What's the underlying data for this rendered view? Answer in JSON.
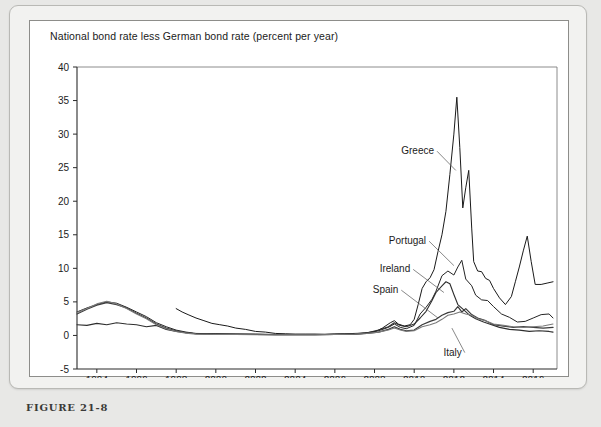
{
  "figure": {
    "caption": "FIGURE 21-8"
  },
  "chart_data": {
    "type": "line",
    "title": "National bond rate less German bond rate (percent per year)",
    "xlabel": "",
    "ylabel": "",
    "xlim": [
      1993.0,
      2017.2
    ],
    "ylim": [
      -5,
      40
    ],
    "ytick_values": [
      -5,
      0,
      5,
      10,
      15,
      20,
      25,
      30,
      35,
      40
    ],
    "ytick_labels": [
      "-5",
      "0",
      "5",
      "10",
      "15",
      "20",
      "25",
      "30",
      "35",
      "40"
    ],
    "xtick_values": [
      1994,
      1996,
      1998,
      2000,
      2002,
      2004,
      2006,
      2008,
      2010,
      2012,
      2014,
      2016
    ],
    "xtick_labels": [
      "1994",
      "1996",
      "1998",
      "2000",
      "2002",
      "2004",
      "2006",
      "2008",
      "2010",
      "2012",
      "2014",
      "2016"
    ],
    "grid": false,
    "legend_position": "inline-annotations",
    "colors": {
      "greece": "#1a1a1a",
      "portugal": "#242424",
      "ireland": "#2e2e2e",
      "spain": "#3a3a3a",
      "italy": "#7a7a7a"
    },
    "annotations": [
      {
        "label": "Greece",
        "label_x": 2011.0,
        "label_y": 27.0,
        "point_x": 2012.1,
        "point_y": 24.6
      },
      {
        "label": "Portugal",
        "label_x": 2010.6,
        "label_y": 13.6,
        "point_x": 2012.0,
        "point_y": 10.4
      },
      {
        "label": "Ireland",
        "label_x": 2009.8,
        "label_y": 9.4,
        "point_x": 2011.5,
        "point_y": 6.4
      },
      {
        "label": "Spain",
        "label_x": 2009.2,
        "label_y": 6.3,
        "point_x": 2011.2,
        "point_y": 2.6
      },
      {
        "label": "Italy",
        "label_x": 2012.4,
        "label_y": -3.0,
        "point_x": 2011.9,
        "point_y": 1.1
      }
    ],
    "series": [
      {
        "name": "Greece",
        "x": [
          1998.0,
          1998.3,
          1998.6,
          1999.0,
          1999.4,
          1999.8,
          2000.2,
          2000.6,
          2001.0,
          2001.5,
          2002.0,
          2002.5,
          2003.0,
          2003.5,
          2004.0,
          2004.5,
          2005.0,
          2005.5,
          2006.0,
          2006.5,
          2007.0,
          2007.5,
          2008.0,
          2008.4,
          2008.8,
          2009.0,
          2009.2,
          2009.5,
          2009.8,
          2010.0,
          2010.2,
          2010.4,
          2010.6,
          2010.8,
          2011.0,
          2011.2,
          2011.4,
          2011.6,
          2011.8,
          2012.0,
          2012.15,
          2012.3,
          2012.45,
          2012.6,
          2012.75,
          2012.9,
          2013.0,
          2013.2,
          2013.4,
          2013.6,
          2013.8,
          2014.0,
          2014.3,
          2014.6,
          2014.9,
          2015.1,
          2015.3,
          2015.5,
          2015.7,
          2015.9,
          2016.1,
          2016.4,
          2016.7,
          2017.0
        ],
        "y": [
          4.0,
          3.5,
          3.1,
          2.6,
          2.2,
          1.8,
          1.6,
          1.4,
          1.1,
          0.9,
          0.6,
          0.5,
          0.3,
          0.25,
          0.2,
          0.2,
          0.2,
          0.15,
          0.2,
          0.25,
          0.3,
          0.35,
          0.5,
          1.1,
          1.9,
          2.2,
          1.7,
          1.4,
          1.6,
          2.4,
          4.6,
          7.0,
          8.0,
          8.6,
          9.8,
          12.5,
          15.0,
          18.5,
          24.0,
          30.0,
          35.5,
          28.0,
          19.0,
          22.0,
          24.6,
          16.0,
          11.0,
          9.6,
          9.5,
          8.5,
          8.2,
          7.0,
          5.6,
          4.6,
          5.8,
          8.0,
          10.2,
          12.6,
          14.8,
          11.0,
          7.6,
          7.6,
          7.8,
          8.0
        ]
      },
      {
        "name": "Portugal",
        "x": [
          1993.0,
          1993.5,
          1994.0,
          1994.5,
          1995.0,
          1995.5,
          1996.0,
          1996.5,
          1997.0,
          1997.5,
          1998.0,
          1998.5,
          1999.0,
          2000.0,
          2001.0,
          2002.0,
          2003.0,
          2004.0,
          2005.0,
          2006.0,
          2007.0,
          2007.6,
          2008.2,
          2008.7,
          2009.0,
          2009.3,
          2009.6,
          2010.0,
          2010.3,
          2010.6,
          2010.9,
          2011.1,
          2011.4,
          2011.7,
          2012.0,
          2012.2,
          2012.4,
          2012.6,
          2012.9,
          2013.1,
          2013.4,
          2013.7,
          2014.0,
          2014.4,
          2014.8,
          2015.2,
          2015.6,
          2016.0,
          2016.4,
          2016.8,
          2017.0
        ],
        "y": [
          3.5,
          4.1,
          4.6,
          5.0,
          4.8,
          4.2,
          3.5,
          2.8,
          1.9,
          1.3,
          0.8,
          0.5,
          0.3,
          0.25,
          0.2,
          0.2,
          0.15,
          0.15,
          0.15,
          0.2,
          0.25,
          0.4,
          0.7,
          1.2,
          1.7,
          1.2,
          1.0,
          1.5,
          3.2,
          4.2,
          5.4,
          6.6,
          8.9,
          9.6,
          9.0,
          10.2,
          11.2,
          8.4,
          7.4,
          6.0,
          5.3,
          5.2,
          4.3,
          3.2,
          2.7,
          2.0,
          2.1,
          2.6,
          3.1,
          3.2,
          2.6
        ]
      },
      {
        "name": "Ireland",
        "x": [
          1993.0,
          1993.5,
          1994.0,
          1994.5,
          1995.0,
          1995.5,
          1996.0,
          1996.5,
          1997.0,
          1997.5,
          1998.0,
          1998.5,
          1999.0,
          2000.0,
          2001.0,
          2002.0,
          2003.0,
          2004.0,
          2005.0,
          2006.0,
          2007.0,
          2007.6,
          2008.2,
          2008.7,
          2009.0,
          2009.3,
          2009.6,
          2010.0,
          2010.3,
          2010.6,
          2010.9,
          2011.1,
          2011.4,
          2011.6,
          2011.8,
          2012.0,
          2012.2,
          2012.5,
          2012.8,
          2013.1,
          2013.5,
          2013.9,
          2014.3,
          2014.8,
          2015.3,
          2015.8,
          2016.3,
          2016.8,
          2017.0
        ],
        "y": [
          1.6,
          1.5,
          1.8,
          1.6,
          1.9,
          1.7,
          1.6,
          1.3,
          1.5,
          0.9,
          0.6,
          0.4,
          0.25,
          0.2,
          0.2,
          0.15,
          0.1,
          0.1,
          0.1,
          0.15,
          0.2,
          0.35,
          0.8,
          1.3,
          1.9,
          1.5,
          1.3,
          1.7,
          2.6,
          3.6,
          5.2,
          6.4,
          7.4,
          8.0,
          7.7,
          6.1,
          4.6,
          3.8,
          3.0,
          2.5,
          2.0,
          1.6,
          1.2,
          0.9,
          0.8,
          0.6,
          0.7,
          0.6,
          0.5
        ]
      },
      {
        "name": "Spain",
        "x": [
          1993.0,
          1993.5,
          1994.0,
          1994.5,
          1995.0,
          1995.5,
          1996.0,
          1996.5,
          1997.0,
          1997.5,
          1998.0,
          1998.5,
          1999.0,
          2000.0,
          2001.0,
          2002.0,
          2003.0,
          2004.0,
          2005.0,
          2006.0,
          2007.0,
          2007.6,
          2008.2,
          2008.7,
          2009.0,
          2009.3,
          2009.6,
          2010.0,
          2010.4,
          2010.8,
          2011.1,
          2011.4,
          2011.7,
          2012.0,
          2012.2,
          2012.4,
          2012.6,
          2012.9,
          2013.2,
          2013.6,
          2014.0,
          2014.5,
          2015.0,
          2015.5,
          2016.0,
          2016.5,
          2017.0
        ],
        "y": [
          3.2,
          3.9,
          4.5,
          4.9,
          4.6,
          4.1,
          3.3,
          2.6,
          1.7,
          1.1,
          0.7,
          0.4,
          0.25,
          0.2,
          0.15,
          0.15,
          0.1,
          0.1,
          0.1,
          0.15,
          0.2,
          0.3,
          0.5,
          0.9,
          1.3,
          0.9,
          0.7,
          0.8,
          1.6,
          2.1,
          2.4,
          3.0,
          3.4,
          3.6,
          4.3,
          3.5,
          4.0,
          3.1,
          2.6,
          2.2,
          1.6,
          1.4,
          1.2,
          1.3,
          1.2,
          1.1,
          1.2
        ]
      },
      {
        "name": "Italy",
        "x": [
          1993.0,
          1993.5,
          1994.0,
          1994.5,
          1995.0,
          1995.5,
          1996.0,
          1996.5,
          1997.0,
          1997.5,
          1998.0,
          1998.5,
          1999.0,
          2000.0,
          2001.0,
          2002.0,
          2003.0,
          2004.0,
          2005.0,
          2006.0,
          2007.0,
          2007.6,
          2008.2,
          2008.7,
          2009.0,
          2009.3,
          2009.6,
          2010.0,
          2010.4,
          2010.8,
          2011.1,
          2011.4,
          2011.7,
          2012.0,
          2012.3,
          2012.6,
          2012.9,
          2013.2,
          2013.6,
          2014.0,
          2014.5,
          2015.0,
          2015.5,
          2016.0,
          2016.5,
          2017.0
        ],
        "y": [
          3.4,
          4.0,
          4.7,
          5.1,
          4.7,
          4.0,
          3.2,
          2.5,
          1.6,
          1.0,
          0.6,
          0.35,
          0.2,
          0.15,
          0.15,
          0.1,
          0.1,
          0.1,
          0.1,
          0.15,
          0.2,
          0.3,
          0.5,
          0.8,
          1.1,
          0.8,
          0.6,
          0.7,
          1.3,
          1.6,
          1.9,
          2.4,
          3.0,
          3.2,
          3.5,
          3.2,
          3.0,
          2.5,
          2.2,
          1.7,
          1.5,
          1.3,
          1.2,
          1.3,
          1.4,
          1.7
        ]
      }
    ]
  }
}
